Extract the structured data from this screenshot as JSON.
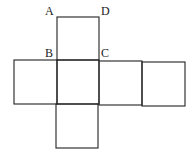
{
  "figure": {
    "type": "cube-net",
    "labels": {
      "A": "A",
      "B": "B",
      "C": "C",
      "D": "D"
    },
    "squares": [
      {
        "name": "top",
        "x": 57,
        "y": 17,
        "w": 42,
        "h": 43
      },
      {
        "name": "left",
        "x": 14,
        "y": 60,
        "w": 43,
        "h": 44
      },
      {
        "name": "center",
        "x": 57,
        "y": 60,
        "w": 42,
        "h": 44
      },
      {
        "name": "right",
        "x": 99,
        "y": 61,
        "w": 43,
        "h": 44
      },
      {
        "name": "far-right",
        "x": 142,
        "y": 62,
        "w": 43,
        "h": 44
      },
      {
        "name": "bottom",
        "x": 56,
        "y": 104,
        "w": 42,
        "h": 44
      }
    ],
    "stroke_color": "#222222"
  }
}
